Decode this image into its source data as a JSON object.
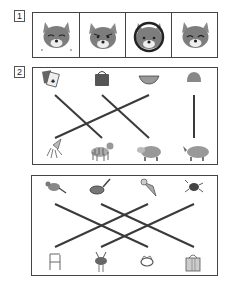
{
  "section1": {
    "number": "1",
    "items": [
      {
        "name": "fox-crying",
        "label": "crying fox face"
      },
      {
        "name": "fox-angry",
        "label": "angry fox face"
      },
      {
        "name": "fox-headphones",
        "label": "fox face with circle outline"
      },
      {
        "name": "fox-laughing",
        "label": "laughing fox face"
      }
    ]
  },
  "section2": {
    "number": "2",
    "panelA": {
      "top": [
        "playing-cards",
        "handbag",
        "watermelon",
        "coin-purse"
      ],
      "bottom": [
        "squid",
        "tiger",
        "hippo",
        "rhino"
      ],
      "lines": [
        {
          "from": "playing-cards",
          "to": "tiger"
        },
        {
          "from": "handbag",
          "to": "hippo"
        },
        {
          "from": "watermelon",
          "to": "squid"
        },
        {
          "from": "coin-purse",
          "to": "rhino"
        }
      ]
    },
    "panelB": {
      "top": [
        "sparrow",
        "frying-pan",
        "ice-cream-cone",
        "beetle"
      ],
      "bottom": [
        "chair",
        "samurai-helmet",
        "tiara",
        "gift-box"
      ],
      "lines": [
        {
          "from": "sparrow",
          "to": "tiara"
        },
        {
          "from": "frying-pan",
          "to": "gift-box"
        },
        {
          "from": "ice-cream-cone",
          "to": "chair"
        },
        {
          "from": "beetle",
          "to": "samurai-helmet"
        }
      ]
    }
  },
  "colors": {
    "line": "#3a3a3a",
    "border": "#444444",
    "icon": "#777777"
  }
}
